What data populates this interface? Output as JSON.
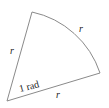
{
  "diagram": {
    "colors": {
      "stroke": "#8a8a8a",
      "text": "#222222",
      "background": "#ffffff"
    },
    "labels": {
      "left_radius": "r",
      "arc_length": "r",
      "bottom_radius": "r",
      "angle": "1 rad"
    },
    "geometry": {
      "center": [
        7,
        101
      ],
      "radius_end_top": [
        32,
        12
      ],
      "radius_end_right": [
        100,
        73
      ]
    }
  }
}
